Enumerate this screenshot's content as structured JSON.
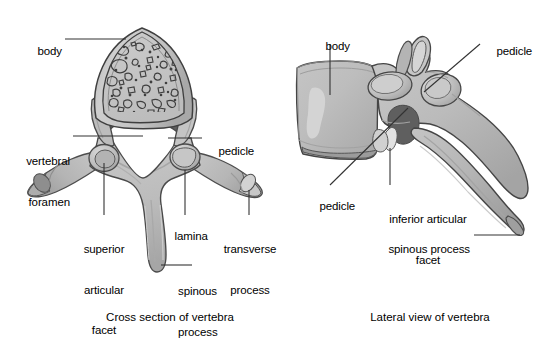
{
  "figure": {
    "background_color": "#ffffff",
    "bone_fill": "#bfbfbf",
    "bone_fill_light": "#cfcfcf",
    "bone_fill_dark": "#9a9a9a",
    "cortical_outline": "#4a4a4a",
    "canal_shadow": "#585858",
    "foramen_white": "#ffffff",
    "text_color": "#000000",
    "leader_color": "#333333"
  },
  "panels": [
    {
      "id": "cross-section",
      "caption": "Cross section of vertebra",
      "labels": [
        {
          "name": "body",
          "text": "body",
          "lines": [
            "body"
          ]
        },
        {
          "name": "vertebral-foramen",
          "text": "vertebral foramen",
          "lines": [
            "vertebral",
            "foramen"
          ]
        },
        {
          "name": "pedicle",
          "text": "pedicle",
          "lines": [
            "pedicle"
          ]
        },
        {
          "name": "superior-articular-facet",
          "text": "superior articular facet",
          "lines": [
            "superior",
            "articular",
            "facet"
          ]
        },
        {
          "name": "lamina",
          "text": "lamina",
          "lines": [
            "lamina"
          ]
        },
        {
          "name": "transverse-process",
          "text": "transverse process",
          "lines": [
            "transverse",
            "process"
          ]
        },
        {
          "name": "spinous-process",
          "text": "spinous process",
          "lines": [
            "spinous",
            "process"
          ]
        }
      ]
    },
    {
      "id": "lateral-view",
      "caption": "Lateral view of vertebra",
      "labels": [
        {
          "name": "body",
          "text": "body",
          "lines": [
            "body"
          ]
        },
        {
          "name": "pedicle-upper",
          "text": "pedicle",
          "lines": [
            "pedicle"
          ]
        },
        {
          "name": "pedicle-lower",
          "text": "pedicle",
          "lines": [
            "pedicle"
          ]
        },
        {
          "name": "inferior-articular-facet",
          "text": "inferior articular facet",
          "lines": [
            "inferior articular",
            "facet"
          ]
        },
        {
          "name": "spinous-process",
          "text": "spinous process",
          "lines": [
            "spinous process"
          ]
        }
      ]
    }
  ],
  "text": {
    "left": {
      "body": "body",
      "vertebral": "vertebral",
      "foramen": "foramen",
      "pedicle": "pedicle",
      "superior": "superior",
      "articular": "articular",
      "facet": "facet",
      "lamina": "lamina",
      "transverse": "transverse",
      "process": "process",
      "spinous": "spinous",
      "spinous_process": "process",
      "caption": "Cross section of vertebra"
    },
    "right": {
      "body": "body",
      "pedicle_upper": "pedicle",
      "pedicle_lower": "pedicle",
      "inferior_articular": "inferior articular",
      "facet": "facet",
      "spinous_process": "spinous process",
      "caption": "Lateral view of vertebra"
    }
  }
}
